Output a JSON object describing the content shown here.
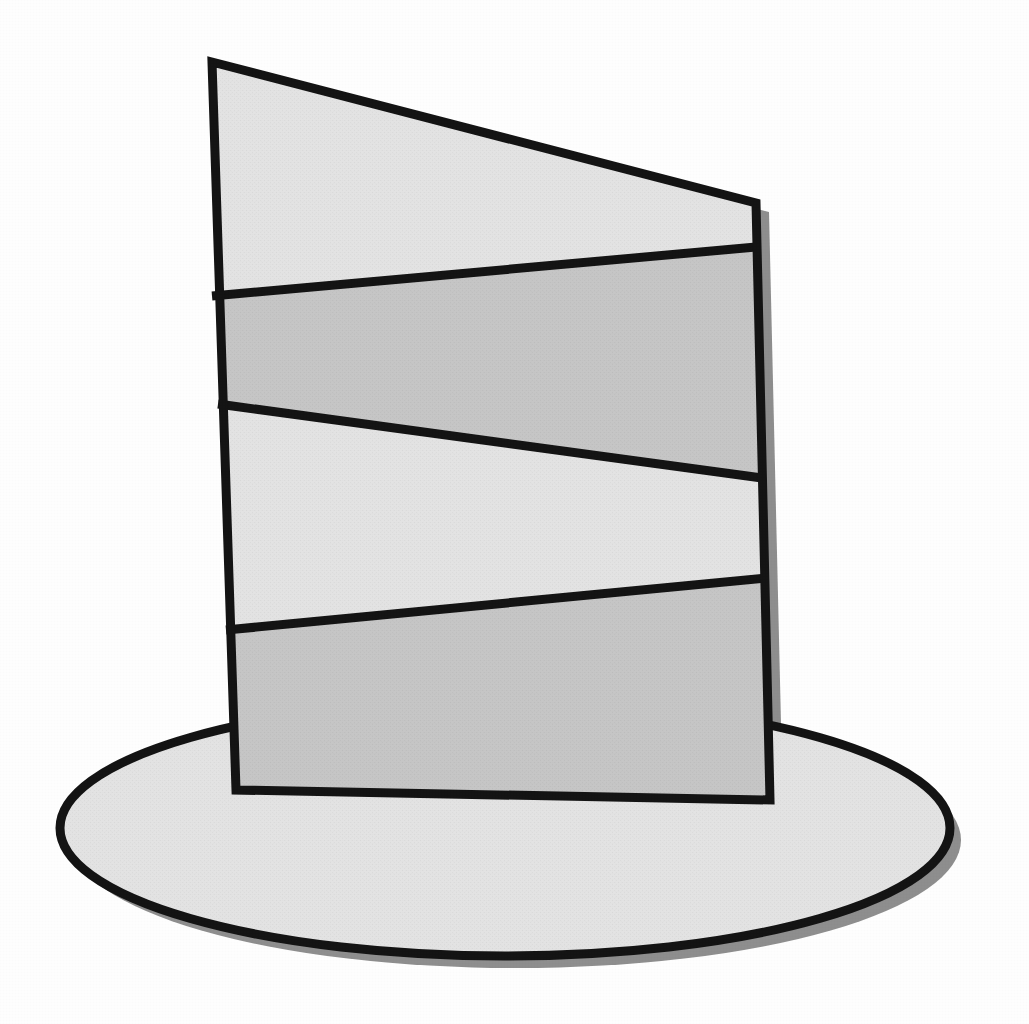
{
  "figure": {
    "title": "Banded vertical panel standing on an elliptical base",
    "background_color": "#fefefe",
    "canvas": {
      "width": 1029,
      "height": 1024
    },
    "outline_color": "#141414",
    "shadow_color": "#8e8e8e",
    "label_panel": "banded-panel",
    "label_base": "elliptical-base"
  },
  "base": {
    "name": "elliptical-base",
    "center_x": 505,
    "center_y": 828,
    "radius_x": 445,
    "radius_y": 128,
    "fill_color": "#e3e3e3",
    "stroke_color": "#141414",
    "stroke_width": 9,
    "shadow_offset_x": 11,
    "shadow_offset_y": 12,
    "shadow_color": "#8e8e8e"
  },
  "panel": {
    "name": "banded-panel",
    "corners": {
      "top_left": {
        "x": 212,
        "y": 62
      },
      "top_right": {
        "x": 756,
        "y": 203
      },
      "bottom_right": {
        "x": 770,
        "y": 800
      },
      "bottom_left": {
        "x": 236,
        "y": 790
      }
    },
    "stroke_color": "#141414",
    "stroke_width": 9,
    "shadow_offset_x": 13,
    "shadow_offset_y": 9,
    "shadow_color": "#8e8e8e",
    "divider_stroke_width": 9
  },
  "bands": [
    {
      "index": 1,
      "name": "band-top",
      "tone": "light",
      "fill_color": "#e3e3e3",
      "left_top_y": 62,
      "right_top_y": 203,
      "left_bottom_y": 296,
      "right_bottom_y": 247
    },
    {
      "index": 2,
      "name": "band-second",
      "tone": "dark",
      "fill_color": "#c6c6c6",
      "left_top_y": 296,
      "right_top_y": 247,
      "left_bottom_y": 404,
      "right_bottom_y": 478
    },
    {
      "index": 3,
      "name": "band-third",
      "tone": "light",
      "fill_color": "#e3e3e3",
      "left_top_y": 404,
      "right_top_y": 478,
      "left_bottom_y": 630,
      "right_bottom_y": 578
    },
    {
      "index": 4,
      "name": "band-bottom",
      "tone": "dark",
      "fill_color": "#c6c6c6",
      "left_top_y": 630,
      "right_top_y": 578,
      "left_bottom_y": 790,
      "right_bottom_y": 800
    }
  ],
  "dividers": [
    {
      "name": "divider-1",
      "x1": 212,
      "y1": 296,
      "x2": 756,
      "y2": 247
    },
    {
      "name": "divider-2",
      "x1": 218,
      "y1": 404,
      "x2": 762,
      "y2": 478
    },
    {
      "name": "divider-3",
      "x1": 226,
      "y1": 630,
      "x2": 766,
      "y2": 578
    }
  ]
}
